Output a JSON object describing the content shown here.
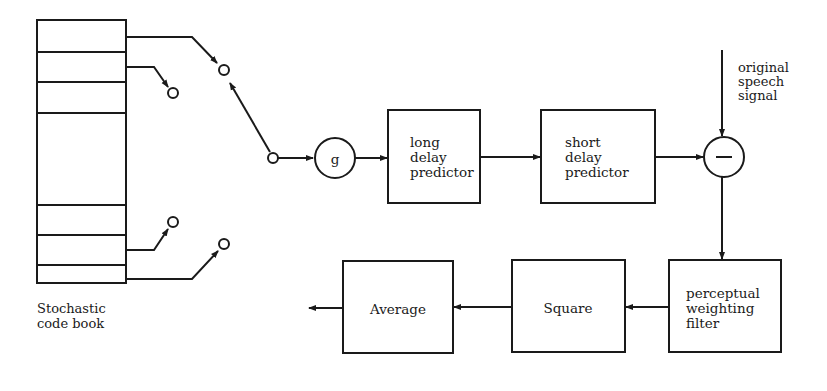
{
  "diagram": {
    "codebook": {
      "label_line1": "Stochastic",
      "label_line2": "code book"
    },
    "gain": {
      "label": "g"
    },
    "long_delay_predictor": {
      "line1": "long",
      "line2": "delay",
      "line3": "predictor"
    },
    "short_delay_predictor": {
      "line1": "short",
      "line2": "delay",
      "line3": "predictor"
    },
    "subtractor": {
      "label": "−"
    },
    "original_speech": {
      "line1": "original",
      "line2": "speech",
      "line3": "signal"
    },
    "perceptual_filter": {
      "line1": "perceptual",
      "line2": "weighting",
      "line3": "filter"
    },
    "square": {
      "label": "Square"
    },
    "average": {
      "label": "Average"
    },
    "colors": {
      "stroke": "#1a1a1a",
      "background": "#ffffff"
    }
  }
}
